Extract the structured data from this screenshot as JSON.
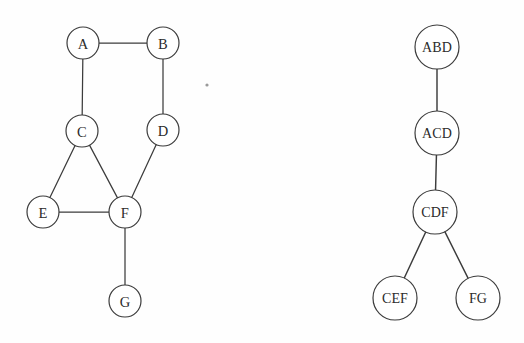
{
  "figure": {
    "background_color": "#fefefe",
    "stroke_color": "#3c3c3c",
    "label_color": "#2b2b2b",
    "width": 524,
    "height": 343
  },
  "left_graph": {
    "name": "undirected-graph",
    "node_radius": 16,
    "nodes": [
      {
        "id": "A",
        "label": "A",
        "cx": 83,
        "cy": 43
      },
      {
        "id": "B",
        "label": "B",
        "cx": 163,
        "cy": 43
      },
      {
        "id": "C",
        "label": "C",
        "cx": 82,
        "cy": 131
      },
      {
        "id": "D",
        "label": "D",
        "cx": 163,
        "cy": 130
      },
      {
        "id": "E",
        "label": "E",
        "cx": 43,
        "cy": 212
      },
      {
        "id": "F",
        "label": "F",
        "cx": 125,
        "cy": 212
      },
      {
        "id": "G",
        "label": "G",
        "cx": 125,
        "cy": 301
      }
    ],
    "edges": [
      {
        "from": "A",
        "to": "B"
      },
      {
        "from": "A",
        "to": "C"
      },
      {
        "from": "B",
        "to": "D"
      },
      {
        "from": "C",
        "to": "E"
      },
      {
        "from": "C",
        "to": "F"
      },
      {
        "from": "E",
        "to": "F"
      },
      {
        "from": "D",
        "to": "F"
      },
      {
        "from": "F",
        "to": "G"
      }
    ]
  },
  "right_tree": {
    "name": "tree-decomposition",
    "node_radius": 22,
    "nodes": [
      {
        "id": "ABD",
        "label": "ABD",
        "cx": 437,
        "cy": 47
      },
      {
        "id": "ACD",
        "label": "ACD",
        "cx": 437,
        "cy": 133
      },
      {
        "id": "CDF",
        "label": "CDF",
        "cx": 435,
        "cy": 212
      },
      {
        "id": "CEF",
        "label": "CEF",
        "cx": 395,
        "cy": 298
      },
      {
        "id": "FG",
        "label": "FG",
        "cx": 478,
        "cy": 298
      }
    ],
    "edges": [
      {
        "from": "ABD",
        "to": "ACD"
      },
      {
        "from": "ACD",
        "to": "CDF"
      },
      {
        "from": "CDF",
        "to": "CEF"
      },
      {
        "from": "CDF",
        "to": "FG"
      }
    ]
  },
  "artifacts": [
    {
      "name": "scan-speck",
      "cx": 207,
      "cy": 85,
      "r": 1.6
    }
  ]
}
